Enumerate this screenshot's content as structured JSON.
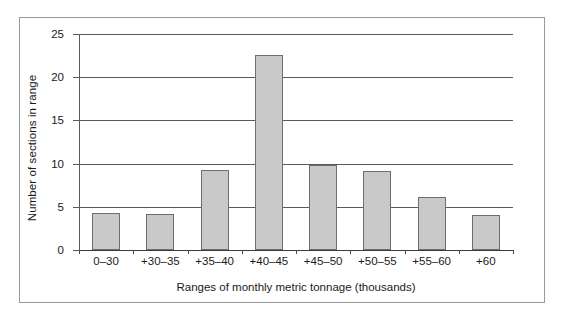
{
  "chart_data": {
    "type": "bar",
    "title": "",
    "xlabel": "Ranges of monthly metric tonnage (thousands)",
    "ylabel": "Number of sections in range",
    "categories": [
      "0–30",
      "+30–35",
      "+35–40",
      "+40–45",
      "+45–50",
      "+50–55",
      "+55–60",
      "+60"
    ],
    "values": [
      4.3,
      4.2,
      9.3,
      22.6,
      9.8,
      9.1,
      6.1,
      4.0
    ],
    "ylim": [
      0,
      25
    ],
    "yticks": [
      0,
      5,
      10,
      15,
      20,
      25
    ],
    "ytick_labels": [
      "0",
      "5",
      "10",
      "15",
      "20",
      "25"
    ],
    "grid": true,
    "grid_axis": "y",
    "legend": null,
    "bar_color": "#c9c9c9",
    "bar_edge_color": "#6e6e6e",
    "axis_color": "#5a5a5a",
    "frame_color": "#9a9a9a",
    "background": "#ffffff"
  }
}
